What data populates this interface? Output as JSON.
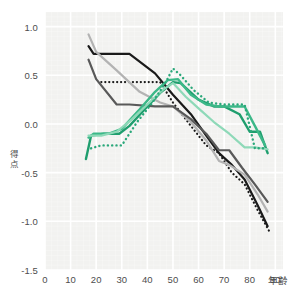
{
  "chart_data": {
    "type": "line",
    "title": "",
    "subtitle": "",
    "xlabel": "年齢",
    "ylabel": "得点",
    "xlim": [
      0,
      93
    ],
    "ylim": [
      -1.5,
      1.15
    ],
    "grid": true,
    "legend_position": "none",
    "xticks": [
      0,
      10,
      20,
      30,
      40,
      50,
      60,
      70,
      80,
      90
    ],
    "xtick_labels": [
      "0",
      "10",
      "20",
      "30",
      "40",
      "50",
      "60",
      "70",
      "80",
      "90"
    ],
    "yticks": [
      1.0,
      0.5,
      0.0,
      -0.5,
      -1.0,
      -1.5
    ],
    "ytick_labels": [
      "1.0",
      "0.5",
      "0.0",
      "-0.5",
      "-1.0",
      "-1.5"
    ],
    "plot_background": "#f2f2f0",
    "gridline_color": "#ffffff",
    "series": [
      {
        "name": "black-solid",
        "color": "#1a1a1a",
        "style": "solid",
        "width": 2.2,
        "x": [
          17,
          19,
          33,
          43,
          50,
          57,
          63,
          68,
          73,
          78,
          83,
          87
        ],
        "values": [
          0.8,
          0.72,
          0.72,
          0.52,
          0.3,
          0.1,
          -0.12,
          -0.3,
          -0.42,
          -0.57,
          -0.83,
          -1.05
        ]
      },
      {
        "name": "black-dotted",
        "color": "#1a1a1a",
        "style": "dotted",
        "width": 2.2,
        "x": [
          22,
          42,
          45,
          50,
          57,
          63,
          68,
          73,
          78,
          83,
          88
        ],
        "values": [
          0.43,
          0.43,
          0.43,
          0.22,
          -0.02,
          -0.22,
          -0.3,
          -0.5,
          -0.62,
          -0.88,
          -1.12
        ]
      },
      {
        "name": "light-gray-solid",
        "color": "#b3b3b3",
        "style": "solid",
        "width": 2.2,
        "x": [
          17,
          20,
          28,
          37,
          45,
          50,
          57,
          63,
          68,
          72,
          78,
          83,
          87
        ],
        "values": [
          0.92,
          0.74,
          0.55,
          0.33,
          0.22,
          0.18,
          0.02,
          -0.17,
          -0.38,
          -0.42,
          -0.52,
          -0.72,
          -0.9
        ]
      },
      {
        "name": "dark-gray-solid",
        "color": "#595959",
        "style": "solid",
        "width": 2.2,
        "x": [
          17,
          20,
          28,
          33,
          43,
          50,
          57,
          63,
          68,
          72,
          77,
          82,
          87
        ],
        "values": [
          0.66,
          0.46,
          0.2,
          0.2,
          0.18,
          0.18,
          0.05,
          -0.1,
          -0.27,
          -0.27,
          -0.45,
          -0.62,
          -0.8
        ]
      },
      {
        "name": "green-dark-solid",
        "color": "#1f9e6e",
        "style": "solid",
        "width": 2.4,
        "x": [
          16,
          18,
          23,
          29,
          33,
          40,
          45,
          50,
          53,
          60,
          66,
          70,
          76,
          80,
          84,
          87
        ],
        "values": [
          -0.36,
          -0.12,
          -0.1,
          -0.1,
          -0.02,
          0.18,
          0.32,
          0.43,
          0.42,
          0.25,
          0.18,
          0.18,
          0.1,
          -0.08,
          -0.08,
          -0.3
        ]
      },
      {
        "name": "green-mid-solid",
        "color": "#3cb888",
        "style": "solid",
        "width": 2.4,
        "x": [
          17,
          19,
          25,
          30,
          37,
          43,
          48,
          52,
          57,
          63,
          68,
          72,
          78,
          82,
          86
        ],
        "values": [
          -0.14,
          -0.1,
          -0.1,
          -0.05,
          0.15,
          0.33,
          0.45,
          0.46,
          0.3,
          0.2,
          0.18,
          0.18,
          0.18,
          -0.02,
          -0.22
        ]
      },
      {
        "name": "green-light-solid",
        "color": "#8ed9b8",
        "style": "solid",
        "width": 2.2,
        "x": [
          17,
          22,
          28,
          34,
          40,
          46,
          50,
          55,
          60,
          66,
          72,
          78,
          82,
          87
        ],
        "values": [
          -0.12,
          -0.12,
          -0.08,
          0.05,
          0.2,
          0.35,
          0.42,
          0.28,
          0.16,
          0.02,
          -0.1,
          -0.24,
          -0.24,
          -0.26
        ]
      },
      {
        "name": "green-dotted",
        "color": "#2aa87a",
        "style": "dotted",
        "width": 2.4,
        "x": [
          18,
          22,
          30,
          36,
          42,
          47,
          50,
          53,
          58,
          64,
          70,
          74,
          78,
          82,
          86
        ],
        "values": [
          -0.25,
          -0.22,
          -0.22,
          0.02,
          0.22,
          0.42,
          0.57,
          0.5,
          0.35,
          0.22,
          0.2,
          0.2,
          0.2,
          -0.25,
          -0.25
        ]
      }
    ]
  }
}
